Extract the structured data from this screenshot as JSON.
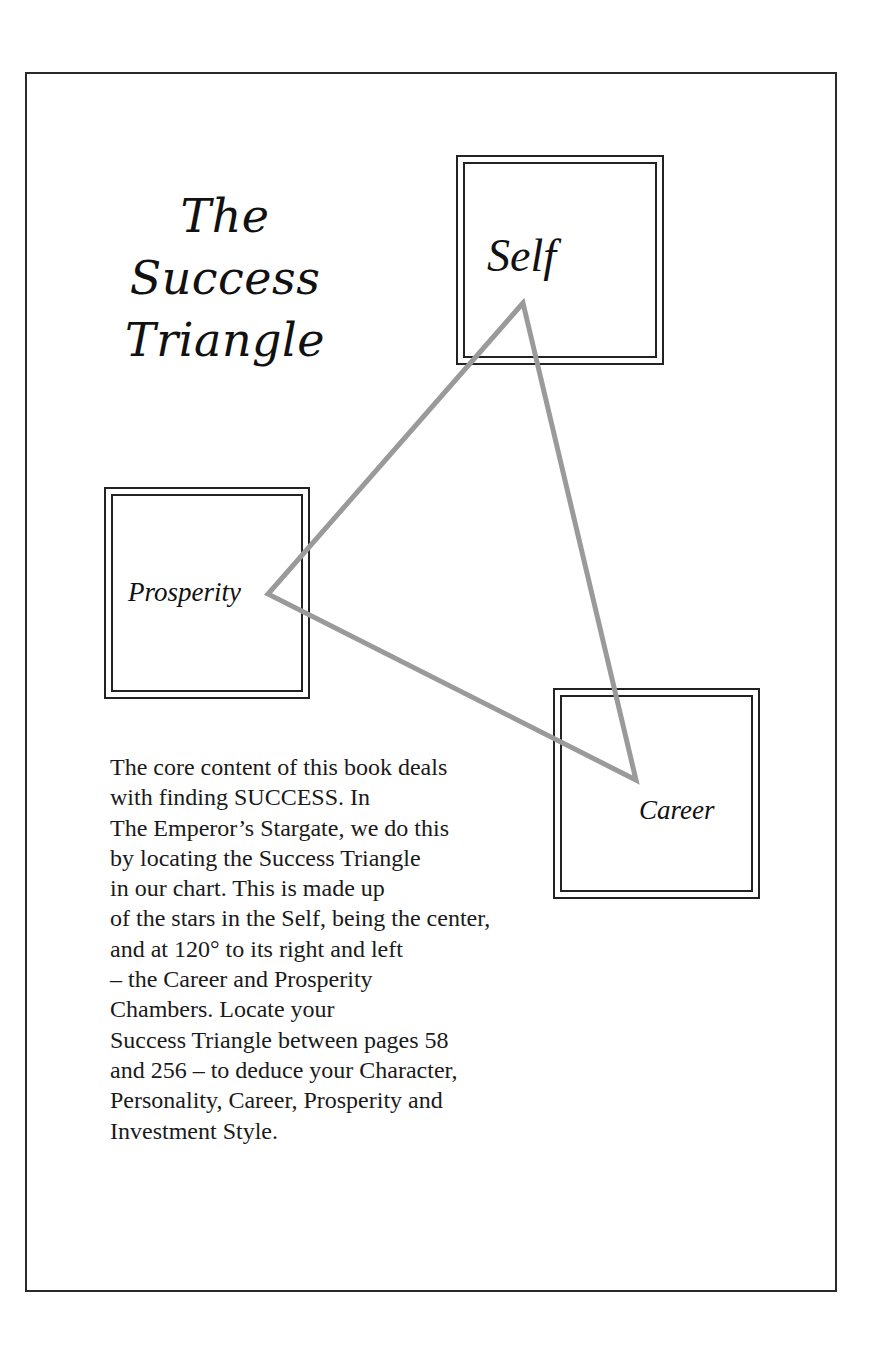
{
  "document": {
    "title_lines": [
      "The",
      "Success",
      "Triangle"
    ],
    "chambers": {
      "self": {
        "label": "Self"
      },
      "prosperity": {
        "label": "Prosperity"
      },
      "career": {
        "label": "Career"
      }
    },
    "triangle": {
      "stroke_color": "#9a9a9a",
      "vertices": {
        "self": [
          523,
          303
        ],
        "prosperity": [
          268,
          594
        ],
        "career": [
          636,
          780
        ]
      }
    },
    "body_lines": [
      "The core content of this book deals",
      "with finding SUCCESS. In",
      "The Emperor’s Stargate, we do this",
      "by locating the Success Triangle",
      "in our chart. This is made up",
      "of the stars in the Self, being the center,",
      "and at 120° to its right and left",
      "– the Career and Prosperity",
      "Chambers. Locate your",
      "Success Triangle between pages 58",
      "and 256 – to deduce your Character,",
      "Personality, Career, Prosperity and",
      "Investment Style."
    ]
  }
}
